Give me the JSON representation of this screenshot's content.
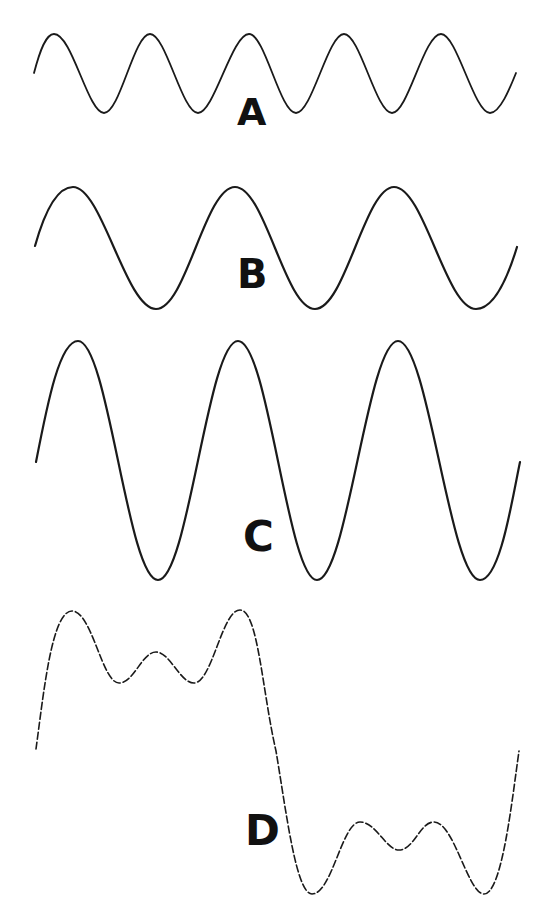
{
  "diagram": {
    "title": "",
    "waves": [
      {
        "label": "A",
        "description": "small-amplitude, high-frequency sine wave (5 cycles)",
        "path": "M34,73 C40,50 46,34 54,34 C72,34 88,113 104,113 C120,113 134,34 150,34 C166,34 182,113 198,113 C214,113 232,34 249,34 C265,34 280,113 296,113 C312,113 328,34 344,34 C360,34 376,113 392,113 C408,113 424,34 441,34 C457,34 474,113 490,113 C500,113 510,88 516,73",
        "stroke_width": 1.8,
        "label_pos": {
          "left": 237,
          "top": 93,
          "size": 38
        }
      },
      {
        "label": "B",
        "description": "medium-amplitude, lower-frequency sine wave (3 cycles)",
        "path": "M35,246 C44,214 56,187 73,187 C102,187 126,309 156,309 C186,309 205,187 235,187 C265,187 285,309 315,309 C345,309 365,187 394,187 C424,187 446,309 476,309 C496,309 510,270 517,247",
        "stroke_width": 2.2,
        "label_pos": {
          "left": 237,
          "top": 254,
          "size": 40
        }
      },
      {
        "label": "C",
        "description": "large-amplitude sine wave, same frequency as B (3 cycles)",
        "path": "M36,462 C48,400 60,341 78,341 C108,341 128,580 158,580 C188,580 208,341 238,341 C268,341 288,580 317,580 C347,580 368,341 398,341 C428,341 450,580 480,580 C500,580 512,500 520,462",
        "stroke_width": 2.2,
        "label_pos": {
          "left": 243,
          "top": 516,
          "size": 42
        }
      },
      {
        "label": "D",
        "description": "sum of harmonics approximating a square wave (dashed)",
        "path": "M36,749 C44,690 52,611 72,611 C92,611 102,683 119,683 C134,683 142,652 156,652 C170,652 180,683 194,683 C212,683 222,610 240,610 C258,610 262,690 276,751 C286,810 296,894 312,894 C332,894 342,822 360,822 C376,822 386,850 399,850 C414,850 420,822 434,822 C454,822 468,894 484,894 C502,894 512,800 519,751",
        "stroke_width": 1.6,
        "dash": "7 3",
        "label_pos": {
          "left": 245,
          "top": 810,
          "size": 42
        }
      }
    ]
  }
}
